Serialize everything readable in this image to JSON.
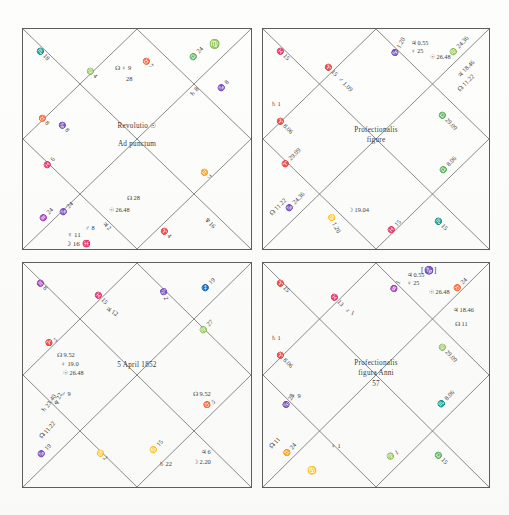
{
  "page": {
    "kind": "scanned-page",
    "background_color": "#fdfdfc",
    "ink_color": "#3c3c3c",
    "rule_color": "#6b6b6b"
  },
  "charts": [
    {
      "id": "chart-top-left",
      "name": "revolutio-ad-punctum",
      "center_lines": [
        "Revolutio ☉",
        "Ad punctum"
      ],
      "corner_label": "♍",
      "annotations": [
        {
          "text": "♏ 18",
          "pos": "outer-top-left"
        },
        {
          "text": "♍ 4",
          "pos": "inner-top-left"
        },
        {
          "text": "♉ 7",
          "pos": "top-center-right"
        },
        {
          "text": "☊ ♀ 9",
          "pos": "top-center"
        },
        {
          "text": "28",
          "pos": "top-center-below"
        },
        {
          "text": "♎ 24",
          "pos": "outer-top-right"
        },
        {
          "text": "♄ 8",
          "pos": "upper-right"
        },
        {
          "text": "♑ 8",
          "pos": "upper-right-inner"
        },
        {
          "text": "♉ 8",
          "pos": "left-upper"
        },
        {
          "text": "♑ 8",
          "pos": "left-upper-2"
        },
        {
          "text": "♓ 6",
          "pos": "left-mid"
        },
        {
          "text": "♒ 24",
          "pos": "left-lower"
        },
        {
          "text": "♑ 24",
          "pos": "left-lower-2"
        },
        {
          "text": "☊ 28",
          "pos": "bottom-center-right"
        },
        {
          "text": "☉ 26.48",
          "pos": "bottom-center-sun"
        },
        {
          "text": "♃ 2",
          "pos": "bottom-center"
        },
        {
          "text": "♂ 8",
          "pos": "bottom-center-left"
        },
        {
          "text": "♀ 11",
          "pos": "bottom-left-venus"
        },
        {
          "text": "☽ 16 ♓",
          "pos": "bottom-left-moon"
        },
        {
          "text": "♈ 4",
          "pos": "bottom-right"
        },
        {
          "text": "♊ 7",
          "pos": "right-lower"
        },
        {
          "text": "♆ 16",
          "pos": "right-bottom"
        }
      ]
    },
    {
      "id": "chart-top-right",
      "name": "profectionalis-figure",
      "center_lines": [
        "Profectionalis",
        "figure"
      ],
      "corner_label": "",
      "annotations": [
        {
          "text": "♓ 15",
          "pos": "outer-top-left"
        },
        {
          "text": "♈ 15",
          "pos": "inner-top-left"
        },
        {
          "text": "♂ 1.09",
          "pos": "top-left-mars"
        },
        {
          "text": "♑ 1.20",
          "pos": "top-center"
        },
        {
          "text": "♃ 0.55",
          "pos": "top-right-1"
        },
        {
          "text": "♀ 25",
          "pos": "top-right-2"
        },
        {
          "text": "☉ 26.48",
          "pos": "top-right-sun"
        },
        {
          "text": "♍ 24.36",
          "pos": "top-right-3"
        },
        {
          "text": "♃ 18.46",
          "pos": "top-right-4"
        },
        {
          "text": "☊ 11.22",
          "pos": "top-right-5"
        },
        {
          "text": "♄ 1",
          "pos": "left-saturn"
        },
        {
          "text": "♈ 8.06",
          "pos": "left-upper"
        },
        {
          "text": "♎ 29.09",
          "pos": "right-upper"
        },
        {
          "text": "♈ 29.09",
          "pos": "left-lower"
        },
        {
          "text": "♎ 8.06",
          "pos": "right-lower"
        },
        {
          "text": "☊ 11.22",
          "pos": "bottom-left-1"
        },
        {
          "text": "♑ 24.36",
          "pos": "bottom-left-2"
        },
        {
          "text": "♋ 1.20",
          "pos": "bottom-center-left"
        },
        {
          "text": "☽ 19.04",
          "pos": "bottom-center-moon"
        },
        {
          "text": "♓ 15",
          "pos": "bottom-center-right"
        },
        {
          "text": "♏ 15",
          "pos": "bottom-right"
        }
      ]
    },
    {
      "id": "chart-bottom-left",
      "name": "nativity-5-april-1852",
      "center_lines": [
        "5 April 1852"
      ],
      "corner_label": "",
      "annotations": [
        {
          "text": "♒ 8",
          "pos": "outer-top-left"
        },
        {
          "text": "♓ 15",
          "pos": "inner-top-left"
        },
        {
          "text": "♃ 12",
          "pos": "top-left-jupiter"
        },
        {
          "text": "♑ 2",
          "pos": "top-center"
        },
        {
          "text": "♐ 19",
          "pos": "outer-top-right"
        },
        {
          "text": "♍ 27",
          "pos": "upper-right"
        },
        {
          "text": "♈ 5",
          "pos": "left-upper"
        },
        {
          "text": "☊ 9.52",
          "pos": "left-node"
        },
        {
          "text": "♀ 19.0",
          "pos": "left-venus"
        },
        {
          "text": "☉ 26.48",
          "pos": "left-sun"
        },
        {
          "text": "♂ 9",
          "pos": "left-mars"
        },
        {
          "text": "♆ 22",
          "pos": "left-uranus"
        },
        {
          "text": "♄ 23.40",
          "pos": "left-saturn"
        },
        {
          "text": "☊ 11.22",
          "pos": "left-node-2"
        },
        {
          "text": "♑ 19",
          "pos": "left-bottom"
        },
        {
          "text": "♋ 2",
          "pos": "bottom-center"
        },
        {
          "text": "♋ 15",
          "pos": "bottom-mid"
        },
        {
          "text": "♄ 22",
          "pos": "bottom-saturn"
        },
        {
          "text": "☽ 2.20",
          "pos": "bottom-moon"
        },
        {
          "text": "♃ 6",
          "pos": "bottom-right-jupiter"
        },
        {
          "text": "☊ 9.52",
          "pos": "right-node"
        },
        {
          "text": "♉ 5",
          "pos": "right-mid"
        }
      ]
    },
    {
      "id": "chart-bottom-right",
      "name": "profectionalis-figura-anni-57",
      "center_lines": [
        "Profectionalis",
        "figura Anni",
        "57"
      ],
      "corner_label": "[♑]",
      "annotations": [
        {
          "text": "♈ 15",
          "pos": "outer-top-left"
        },
        {
          "text": "♓ 13",
          "pos": "inner-top-left"
        },
        {
          "text": "♂ 1",
          "pos": "top-left-mars"
        },
        {
          "text": "♒ 1",
          "pos": "top-center"
        },
        {
          "text": "♃ 0.55",
          "pos": "top-right-1"
        },
        {
          "text": "♀ 25",
          "pos": "top-right-2"
        },
        {
          "text": "☉ 26.48",
          "pos": "top-right-sun"
        },
        {
          "text": "♉ 24",
          "pos": "top-right-3"
        },
        {
          "text": "♃ 18.46",
          "pos": "top-right-4"
        },
        {
          "text": "☊ 11",
          "pos": "top-right-5"
        },
        {
          "text": "♄ 1",
          "pos": "left-saturn"
        },
        {
          "text": "♈ 8.06",
          "pos": "left-upper"
        },
        {
          "text": "♍ 29.09",
          "pos": "right-upper"
        },
        {
          "text": "♀ 9",
          "pos": "left-venus"
        },
        {
          "text": "♑ 28",
          "pos": "left-lower"
        },
        {
          "text": "♏ 8.06",
          "pos": "right-lower"
        },
        {
          "text": "☊ 11",
          "pos": "bottom-left-1"
        },
        {
          "text": "♊ 24",
          "pos": "bottom-left-2"
        },
        {
          "text": "♋",
          "pos": "bottom-left-3"
        },
        {
          "text": "♀ 1",
          "pos": "bottom-center"
        },
        {
          "text": "♍ 1",
          "pos": "bottom-mid-right"
        },
        {
          "text": "♎ 15",
          "pos": "bottom-right"
        }
      ]
    }
  ]
}
